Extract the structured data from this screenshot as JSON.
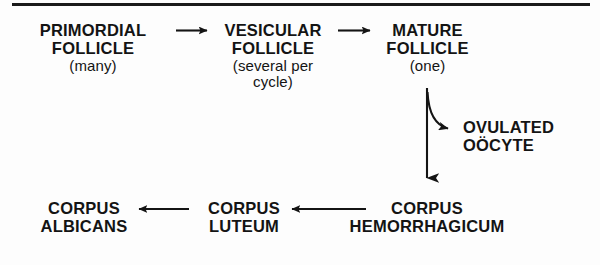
{
  "figure": {
    "type": "flow-diagram",
    "background_color": "#fdfdfd",
    "ink_color": "#141414",
    "top_rule": true
  },
  "nodes": [
    {
      "id": "primordial-follicle",
      "line1": "PRIMORDIAL",
      "line2": "FOLLICLE",
      "qualifier": "(many)"
    },
    {
      "id": "vesicular-follicle",
      "line1": "VESICULAR",
      "line2": "FOLLICLE",
      "qualifier": "(several per",
      "qualifier2": "cycle)"
    },
    {
      "id": "mature-follicle",
      "line1": "MATURE",
      "line2": "FOLLICLE",
      "qualifier": "(one)"
    },
    {
      "id": "ovulated-oocyte",
      "line1": "OVULATED",
      "line2": "OÖCYTE"
    },
    {
      "id": "corpus-hemorrhagicum",
      "line1": "CORPUS",
      "line2": "HEMORRHAGICUM"
    },
    {
      "id": "corpus-luteum",
      "line1": "CORPUS",
      "line2": "LUTEUM"
    },
    {
      "id": "corpus-albicans",
      "line1": "CORPUS",
      "line2": "ALBICANS"
    }
  ],
  "arrows": [
    {
      "id": "primordial-to-vesicular",
      "direction": "right"
    },
    {
      "id": "vesicular-to-mature",
      "direction": "right"
    },
    {
      "id": "mature-to-oocyte",
      "direction": "curved-down-right"
    },
    {
      "id": "mature-to-hemorrhagicum",
      "direction": "down"
    },
    {
      "id": "hemorrhagicum-to-luteum",
      "direction": "left"
    },
    {
      "id": "luteum-to-albicans",
      "direction": "left"
    }
  ]
}
